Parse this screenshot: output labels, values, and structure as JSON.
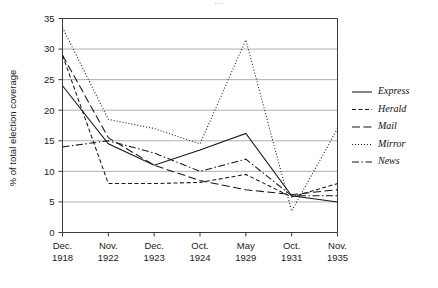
{
  "page": {
    "cropped_header_text": "..."
  },
  "chart_data": {
    "type": "line",
    "title": "",
    "xlabel": "",
    "ylabel": "% of total election coverage",
    "ylim": [
      0,
      35
    ],
    "ytick_step": 5,
    "yticks": [
      "0",
      "5",
      "10",
      "15",
      "20",
      "25",
      "30",
      "35"
    ],
    "grid": true,
    "legend_position": "right",
    "categories": [
      "Dec.\n1918",
      "Nov.\n1922",
      "Dec.\n1923",
      "Oct.\n1924",
      "May\n1929",
      "Oct.\n1931",
      "Nov.\n1935"
    ],
    "category_lines": [
      [
        "Dec.",
        "1918"
      ],
      [
        "Nov.",
        "1922"
      ],
      [
        "Dec.",
        "1923"
      ],
      [
        "Oct.",
        "1924"
      ],
      [
        "May",
        "1929"
      ],
      [
        "Oct.",
        "1931"
      ],
      [
        "Nov.",
        "1935"
      ]
    ],
    "series": [
      {
        "name": "Express",
        "style": "solid",
        "dasharray": "",
        "values": [
          24.0,
          14.5,
          11.0,
          13.5,
          16.2,
          6.0,
          5.0
        ]
      },
      {
        "name": "Herald",
        "style": "dashed-short",
        "dasharray": "4,2.5",
        "values": [
          29.0,
          8.0,
          8.0,
          8.2,
          9.5,
          5.8,
          8.0
        ]
      },
      {
        "name": "Mail",
        "style": "dashed-long",
        "dasharray": "8,3.5",
        "values": [
          29.0,
          15.5,
          11.0,
          8.5,
          7.0,
          6.2,
          7.0
        ]
      },
      {
        "name": "Mirror",
        "style": "dotted",
        "dasharray": "1,2",
        "values": [
          33.5,
          18.5,
          17.0,
          14.5,
          31.5,
          3.5,
          17.0
        ]
      },
      {
        "name": "News",
        "style": "dash-dot",
        "dasharray": "7,2.5,1.5,2.5",
        "values": [
          14.0,
          15.0,
          13.0,
          10.0,
          12.0,
          6.0,
          6.0
        ]
      }
    ]
  },
  "legend": {
    "entries": [
      {
        "label": "Express"
      },
      {
        "label": "Herald"
      },
      {
        "label": "Mail"
      },
      {
        "label": "Mirror"
      },
      {
        "label": "News"
      }
    ]
  }
}
